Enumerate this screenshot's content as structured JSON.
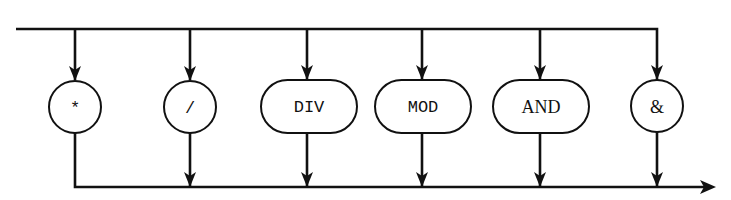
{
  "diagram": {
    "type": "syntax-diagram",
    "title": "",
    "colors": {
      "stroke": "#111111",
      "background": "#ffffff"
    },
    "nodes": [
      {
        "id": "mul",
        "label": "*",
        "shape": "circle"
      },
      {
        "id": "slash",
        "label": "/",
        "shape": "circle"
      },
      {
        "id": "div",
        "label": "DIV",
        "shape": "pill"
      },
      {
        "id": "mod",
        "label": "MOD",
        "shape": "pill"
      },
      {
        "id": "and",
        "label": "AND",
        "shape": "pill"
      },
      {
        "id": "amp",
        "label": "&",
        "shape": "circle"
      }
    ],
    "flow": "entry line at top branches into each alternative; all alternatives merge into exit line at bottom with arrow to the right"
  }
}
